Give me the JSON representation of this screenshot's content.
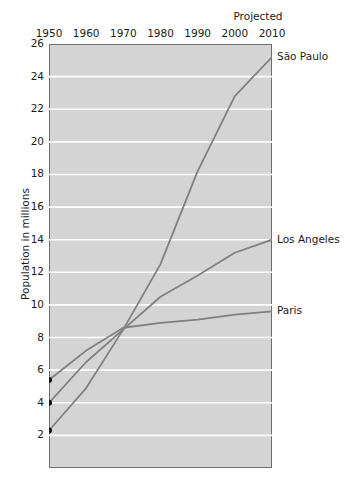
{
  "chart_data": {
    "type": "line",
    "title": "",
    "xlabel": "",
    "ylabel": "Population in millions",
    "x": [
      1950,
      1960,
      1970,
      1980,
      1990,
      2000,
      2010
    ],
    "xlim": [
      1950,
      2010
    ],
    "ylim": [
      0,
      26
    ],
    "ytick_labels": [
      "26",
      "24",
      "22",
      "20",
      "18",
      "16",
      "14",
      "12",
      "10",
      "8",
      "6",
      "4",
      "2"
    ],
    "ytick_values": [
      26,
      24,
      22,
      20,
      18,
      16,
      14,
      12,
      10,
      8,
      6,
      4,
      2
    ],
    "xtick_labels": [
      "1950",
      "1960",
      "1970",
      "1980",
      "1990",
      "2000",
      "2010"
    ],
    "grid": "horizontal-white",
    "legend_position": "right-of-line-ends",
    "annotations": [
      "Projected"
    ],
    "series": [
      {
        "name": "São Paulo",
        "color": "#808080",
        "start_marker": true,
        "values": [
          2.3,
          4.9,
          8.5,
          12.5,
          18.2,
          22.8,
          25.2
        ]
      },
      {
        "name": "Los Angeles",
        "color": "#808080",
        "start_marker": true,
        "values": [
          4.0,
          6.5,
          8.5,
          10.5,
          11.8,
          13.2,
          14.0
        ]
      },
      {
        "name": "Paris",
        "color": "#808080",
        "start_marker": true,
        "values": [
          5.4,
          7.2,
          8.6,
          8.9,
          9.1,
          9.4,
          9.6
        ]
      }
    ]
  },
  "chart": {
    "projected_note": "Projected",
    "y_axis_title": "Population in millions"
  },
  "colors": {
    "plot_background": "#d4d4d4",
    "gridline": "#ffffff",
    "line": "#808080",
    "axis": "#6e6e6e",
    "text": "#1a1a1a"
  }
}
